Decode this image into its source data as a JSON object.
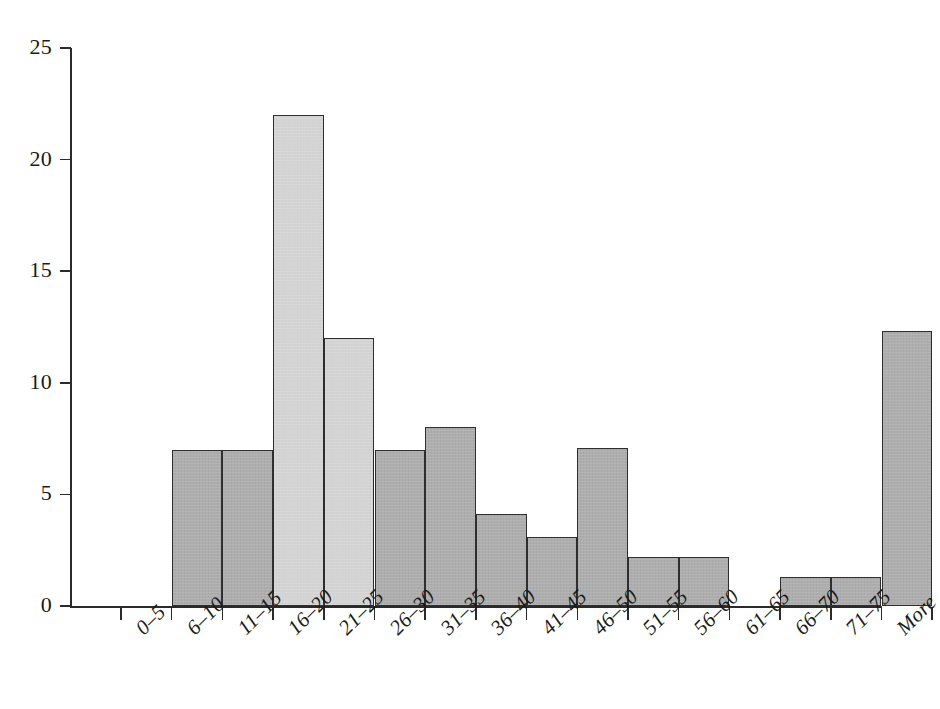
{
  "chart_data": {
    "type": "bar",
    "title": "",
    "subtitle": "",
    "xlabel": "",
    "ylabel": "",
    "grid": false,
    "legend": "none",
    "ylim": [
      0,
      25
    ],
    "yticks": [
      0,
      5,
      10,
      15,
      20,
      25
    ],
    "ytick_labels": [
      "0",
      "5",
      "10",
      "15",
      "20",
      "25"
    ],
    "categories": [
      "0–5",
      "6–10",
      "11–15",
      "16–20",
      "21–25",
      "26–30",
      "31–35",
      "36–40",
      "41–45",
      "46–50",
      "51–55",
      "56–60",
      "61–65",
      "66–70",
      "71–75",
      "More"
    ],
    "values": [
      0,
      7,
      7,
      22,
      12,
      7,
      8,
      4.1,
      3.1,
      7.1,
      2.2,
      2.2,
      0,
      1.3,
      1.3,
      12.3
    ],
    "bar_shades": [
      "none",
      "dark",
      "dark",
      "light",
      "light",
      "dark",
      "dark",
      "dark",
      "dark",
      "dark",
      "dark",
      "dark",
      "none",
      "dark",
      "dark",
      "dark"
    ],
    "colors": {
      "bar_dark": "#ababab",
      "bar_light": "#d4d4d4",
      "bar_outline": "#2e2e2e",
      "axis": "#2b2b2b",
      "text": "#1a1a1a",
      "background": "#ffffff"
    }
  }
}
